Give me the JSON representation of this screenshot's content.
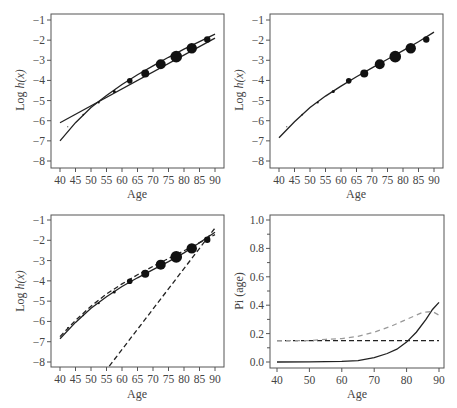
{
  "chart_data": [
    {
      "id": "panel1",
      "type": "line",
      "title": "",
      "xlabel": "Age",
      "ylabel": "Log h(x)",
      "xlim": [
        40,
        90
      ],
      "ylim": [
        -8,
        -1
      ],
      "xticks": [
        40,
        45,
        50,
        55,
        60,
        65,
        70,
        75,
        80,
        85,
        90
      ],
      "yticks": [
        -1,
        -2,
        -3,
        -4,
        -5,
        -6,
        -7,
        -8
      ],
      "grid": false,
      "points": {
        "x": [
          42.5,
          47.5,
          52.5,
          57.5,
          62.5,
          67.5,
          72.5,
          77.5,
          82.5,
          87.5
        ],
        "y": [
          -6.3,
          -5.7,
          -5.1,
          -4.55,
          -4.02,
          -3.65,
          -3.2,
          -2.82,
          -2.4,
          -1.97
        ],
        "size": [
          0.6,
          0.8,
          1.0,
          1.5,
          2.8,
          4.0,
          5.0,
          5.8,
          5.2,
          3.2
        ]
      },
      "series": [
        {
          "name": "linear fit",
          "style": "solid",
          "x": [
            40,
            90
          ],
          "y": [
            -6.1,
            -1.9
          ]
        },
        {
          "name": "curved fit",
          "style": "solid",
          "x": [
            40,
            45,
            50,
            55,
            60,
            65,
            70,
            75,
            80,
            85,
            90
          ],
          "y": [
            -7.0,
            -6.1,
            -5.35,
            -4.75,
            -4.2,
            -3.72,
            -3.28,
            -2.85,
            -2.45,
            -2.07,
            -1.7
          ]
        }
      ]
    },
    {
      "id": "panel2",
      "type": "line",
      "title": "",
      "xlabel": "Age",
      "ylabel": "Log h(x)",
      "xlim": [
        40,
        90
      ],
      "ylim": [
        -8,
        -1
      ],
      "xticks": [
        40,
        45,
        50,
        55,
        60,
        65,
        70,
        75,
        80,
        85,
        90
      ],
      "yticks": [
        -1,
        -2,
        -3,
        -4,
        -5,
        -6,
        -7,
        -8
      ],
      "grid": false,
      "points": {
        "x": [
          42.5,
          47.5,
          52.5,
          57.5,
          62.5,
          67.5,
          72.5,
          77.5,
          82.5,
          87.5
        ],
        "y": [
          -6.3,
          -5.7,
          -5.1,
          -4.55,
          -4.02,
          -3.65,
          -3.2,
          -2.82,
          -2.4,
          -1.97
        ],
        "size": [
          0.6,
          0.8,
          1.0,
          1.5,
          2.8,
          4.0,
          5.0,
          5.8,
          5.2,
          3.2
        ]
      },
      "series": [
        {
          "name": "fit",
          "style": "solid",
          "x": [
            40,
            45,
            50,
            55,
            60,
            65,
            70,
            75,
            80,
            85,
            90
          ],
          "y": [
            -6.85,
            -6.05,
            -5.35,
            -4.78,
            -4.28,
            -3.82,
            -3.38,
            -2.95,
            -2.52,
            -2.08,
            -1.6
          ]
        }
      ]
    },
    {
      "id": "panel3",
      "type": "line",
      "title": "",
      "xlabel": "Age",
      "ylabel": "Log h(x)",
      "xlim": [
        40,
        90
      ],
      "ylim": [
        -8,
        -1
      ],
      "xticks": [
        40,
        45,
        50,
        55,
        60,
        65,
        70,
        75,
        80,
        85,
        90
      ],
      "yticks": [
        -1,
        -2,
        -3,
        -4,
        -5,
        -6,
        -7,
        -8
      ],
      "grid": false,
      "points": {
        "x": [
          42.5,
          47.5,
          52.5,
          57.5,
          62.5,
          67.5,
          72.5,
          77.5,
          82.5,
          87.5
        ],
        "y": [
          -6.3,
          -5.7,
          -5.1,
          -4.55,
          -4.02,
          -3.65,
          -3.2,
          -2.82,
          -2.4,
          -1.97
        ],
        "size": [
          0.6,
          0.8,
          1.0,
          1.5,
          2.8,
          4.0,
          5.0,
          5.8,
          5.2,
          3.2
        ]
      },
      "series": [
        {
          "name": "mixture fit",
          "style": "solid",
          "x": [
            40,
            45,
            50,
            55,
            60,
            65,
            70,
            75,
            80,
            85,
            90
          ],
          "y": [
            -6.85,
            -6.05,
            -5.35,
            -4.78,
            -4.28,
            -3.85,
            -3.45,
            -3.05,
            -2.62,
            -2.12,
            -1.6
          ]
        },
        {
          "name": "component 1",
          "style": "dashed",
          "x": [
            40,
            45,
            50,
            55,
            60,
            65,
            70,
            75,
            80,
            85,
            90
          ],
          "y": [
            -6.75,
            -5.95,
            -5.25,
            -4.65,
            -4.15,
            -3.7,
            -3.28,
            -2.9,
            -2.52,
            -2.12,
            -1.72
          ]
        },
        {
          "name": "component 2",
          "style": "dashed",
          "x": [
            55.9,
            90
          ],
          "y": [
            -8.2,
            -1.4
          ]
        }
      ]
    },
    {
      "id": "panel4",
      "type": "line",
      "title": "",
      "xlabel": "Age",
      "ylabel": "Pi (age)",
      "xlim": [
        40,
        90
      ],
      "ylim": [
        0,
        1
      ],
      "xticks": [
        40,
        50,
        60,
        70,
        80,
        90
      ],
      "yticks": [
        0.0,
        0.2,
        0.4,
        0.6,
        0.8,
        1.0
      ],
      "yminor": [
        0.1,
        0.3,
        0.5,
        0.7,
        0.9
      ],
      "grid": false,
      "series": [
        {
          "name": "Pi(age)",
          "style": "solid",
          "color": "#222222",
          "x": [
            40,
            50,
            60,
            65,
            70,
            74,
            77,
            80,
            83,
            86,
            88,
            90
          ],
          "y": [
            0.0,
            0.001,
            0.004,
            0.01,
            0.03,
            0.06,
            0.09,
            0.14,
            0.21,
            0.3,
            0.37,
            0.42
          ]
        },
        {
          "name": "constant",
          "style": "dashed",
          "color": "#222222",
          "x": [
            40,
            90
          ],
          "y": [
            0.15,
            0.15
          ]
        },
        {
          "name": "smoothed",
          "style": "dashed",
          "color": "#999999",
          "x": [
            40,
            45,
            50,
            55,
            60,
            65,
            70,
            75,
            80,
            85,
            88,
            90
          ],
          "y": [
            0.15,
            0.15,
            0.15,
            0.16,
            0.165,
            0.18,
            0.21,
            0.25,
            0.3,
            0.35,
            0.355,
            0.33
          ]
        }
      ]
    }
  ]
}
